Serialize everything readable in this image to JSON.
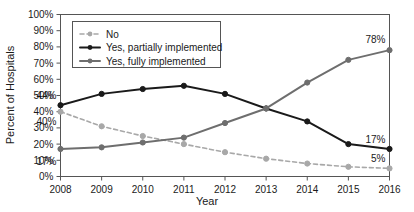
{
  "chart_data": {
    "type": "line",
    "title": "",
    "xlabel": "Year",
    "ylabel": "Percent of Hospitals",
    "x": [
      2008,
      2009,
      2010,
      2011,
      2012,
      2013,
      2014,
      2015,
      2016
    ],
    "categories": [
      "2008",
      "2009",
      "2010",
      "2011",
      "2012",
      "2013",
      "2014",
      "2015",
      "2016"
    ],
    "xlim": [
      2008,
      2016
    ],
    "ylim": [
      0,
      100
    ],
    "ytick_labels": [
      "0%",
      "10%",
      "20%",
      "30%",
      "40%",
      "50%",
      "60%",
      "70%",
      "80%",
      "90%",
      "100%"
    ],
    "ytick_values": [
      0,
      10,
      20,
      30,
      40,
      50,
      60,
      70,
      80,
      90,
      100
    ],
    "grid": false,
    "legend_position": "upper-left-inside",
    "series": [
      {
        "name": "No",
        "values": [
          40,
          31,
          25,
          20,
          15,
          11,
          8,
          6,
          5
        ],
        "color": "#a8a8a8",
        "style": "dashed",
        "marker": "circle"
      },
      {
        "name": "Yes, partially implemented",
        "values": [
          44,
          51,
          54,
          56,
          51,
          42,
          34,
          20,
          17
        ],
        "color": "#1a1a1a",
        "style": "solid",
        "marker": "circle"
      },
      {
        "name": "Yes, fully implemented",
        "values": [
          17,
          18,
          21,
          24,
          33,
          42,
          58,
          72,
          78
        ],
        "color": "#6e6e6e",
        "style": "solid",
        "marker": "circle"
      }
    ],
    "annotations": [
      {
        "text": "44%",
        "x": 2008,
        "y": 44,
        "series": "Yes, partially implemented"
      },
      {
        "text": "40%",
        "x": 2008,
        "y": 40,
        "series": "No"
      },
      {
        "text": "17%",
        "x": 2008,
        "y": 17,
        "series": "Yes, fully implemented"
      },
      {
        "text": "78%",
        "x": 2016,
        "y": 78,
        "series": "Yes, fully implemented"
      },
      {
        "text": "17%",
        "x": 2016,
        "y": 17,
        "series": "Yes, partially implemented"
      },
      {
        "text": "5%",
        "x": 2016,
        "y": 5,
        "series": "No"
      }
    ]
  },
  "axes": {
    "y_title": "Percent of Hospitals",
    "x_title": "Year"
  },
  "legend": {
    "entries": [
      {
        "label": "No"
      },
      {
        "label": "Yes, partially implemented"
      },
      {
        "label": "Yes, fully implemented"
      }
    ]
  },
  "colors": {
    "no": "#a8a8a8",
    "partially": "#1a1a1a",
    "fully": "#6e6e6e",
    "axis": "#555555",
    "text": "#1a1a1a",
    "background": "#ffffff"
  }
}
